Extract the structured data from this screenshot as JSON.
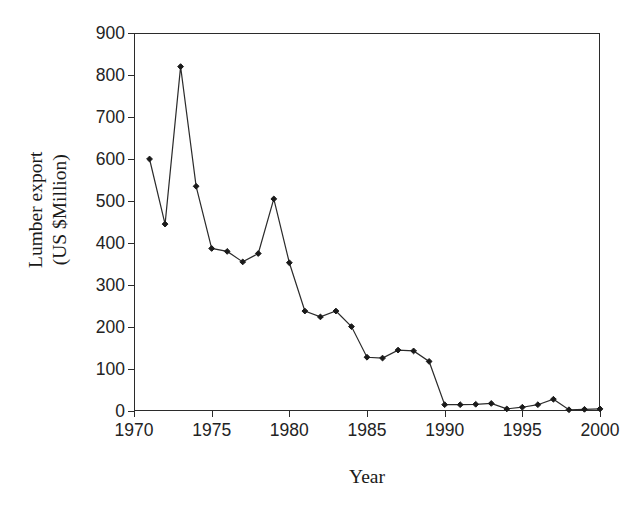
{
  "chart_data": {
    "type": "line",
    "title": "",
    "xlabel": "Year",
    "ylabel": "Lumber export (US $Million)",
    "ylabel_line1": "Lumber export",
    "ylabel_line2": "(US $Million)",
    "xlim": [
      1970,
      2000
    ],
    "ylim": [
      0,
      900
    ],
    "xticks": [
      1970,
      1975,
      1980,
      1985,
      1990,
      1995,
      2000
    ],
    "xtick_labels": [
      "1970",
      "1975",
      "1980",
      "1985",
      "1990",
      "1995",
      "2000"
    ],
    "yticks": [
      0,
      100,
      200,
      300,
      400,
      500,
      600,
      700,
      800,
      900
    ],
    "ytick_labels": [
      "0",
      "100",
      "200",
      "300",
      "400",
      "500",
      "600",
      "700",
      "800",
      "900"
    ],
    "grid": false,
    "legend": false,
    "line_color": "#2b2b2b",
    "marker_color": "#1a1a1a",
    "marker": "diamond",
    "x": [
      1971,
      1972,
      1973,
      1974,
      1975,
      1976,
      1977,
      1978,
      1979,
      1980,
      1981,
      1982,
      1983,
      1984,
      1985,
      1986,
      1987,
      1988,
      1989,
      1990,
      1991,
      1992,
      1993,
      1994,
      1995,
      1996,
      1997,
      1998,
      1999,
      2000
    ],
    "values": [
      600,
      445,
      820,
      535,
      387,
      380,
      355,
      375,
      505,
      353,
      238,
      224,
      238,
      201,
      128,
      126,
      145,
      143,
      118,
      15,
      15,
      16,
      18,
      5,
      9,
      15,
      28,
      3,
      4,
      5
    ],
    "series": [
      {
        "name": "Lumber export",
        "values": [
          600,
          445,
          820,
          535,
          387,
          380,
          355,
          375,
          505,
          353,
          238,
          224,
          238,
          201,
          128,
          126,
          145,
          143,
          118,
          15,
          15,
          16,
          18,
          5,
          9,
          15,
          28,
          3,
          4,
          5
        ]
      }
    ]
  }
}
